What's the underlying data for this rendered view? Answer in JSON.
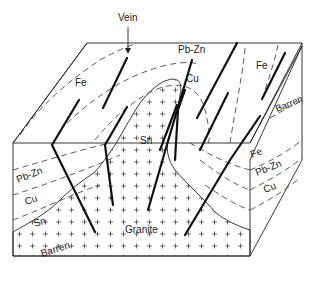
{
  "diagram": {
    "title_label": "Vein",
    "top_face_labels": {
      "fe_left": "Fe",
      "pb_zn": "Pb-Zn",
      "cu": "Cu",
      "fe_right": "Fe",
      "barren_right": "Barren",
      "sn": "Sn"
    },
    "front_face_labels": {
      "pb_zn": "Pb-Zn",
      "cu": "Cu",
      "sn": "Sn",
      "barren": "Barren",
      "granite": "Granite"
    },
    "side_face_labels": {
      "fe": "Fe",
      "pb_zn": "Pb-Zn",
      "cu": "Cu"
    },
    "zonation_sequence": [
      "Fe",
      "Pb-Zn",
      "Cu",
      "Sn",
      "Barren",
      "Granite"
    ]
  }
}
